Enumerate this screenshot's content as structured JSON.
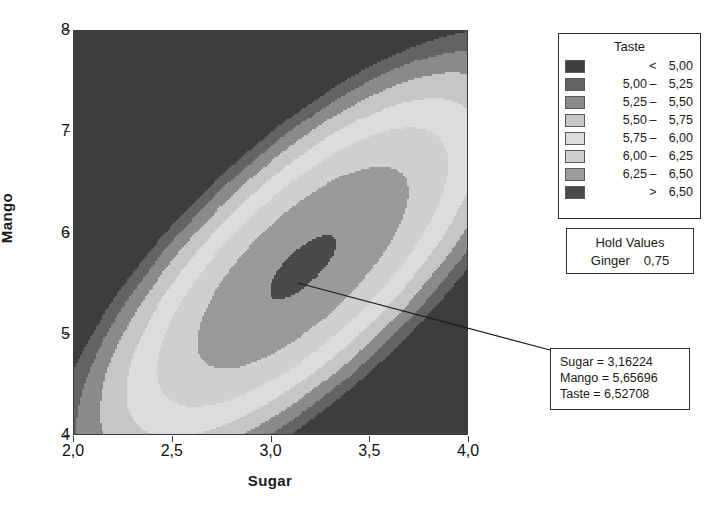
{
  "chart_data": {
    "type": "contour",
    "title": "",
    "xlabel": "Sugar",
    "ylabel": "Mango",
    "xlim": [
      2.0,
      4.0
    ],
    "ylim": [
      4.0,
      8.0
    ],
    "xticks": [
      "2,0",
      "2,5",
      "3,0",
      "3,5",
      "4,0"
    ],
    "xtick_values": [
      2.0,
      2.5,
      3.0,
      3.5,
      4.0
    ],
    "yticks": [
      "4",
      "5",
      "6",
      "7",
      "8"
    ],
    "ytick_values": [
      4,
      5,
      6,
      7,
      8
    ],
    "grid": false,
    "response_variable": "Taste",
    "maximum_point": {
      "Sugar": 3.16224,
      "Mango": 5.65696,
      "Taste": 6.52708
    },
    "hold_values": {
      "Ginger": 0.75
    },
    "levels": [
      5.0,
      5.25,
      5.5,
      5.75,
      6.0,
      6.25,
      6.5
    ],
    "bands": [
      {
        "label": "< 5,00",
        "lo": null,
        "hi": 5.0,
        "color": "#3d3d3d"
      },
      {
        "label": "5,00 - 5,25",
        "lo": 5.0,
        "hi": 5.25,
        "color": "#636363"
      },
      {
        "label": "5,25 - 5,50",
        "lo": 5.25,
        "hi": 5.5,
        "color": "#8a8a8a"
      },
      {
        "label": "5,50 - 5,75",
        "lo": 5.5,
        "hi": 5.75,
        "color": "#c6c6c6"
      },
      {
        "label": "5,75 - 6,00",
        "lo": 5.75,
        "hi": 6.0,
        "color": "#dcdcdc"
      },
      {
        "label": "6,00 - 6,25",
        "lo": 6.0,
        "hi": 6.25,
        "color": "#cfcfcf"
      },
      {
        "label": "6,25 - 6,50",
        "lo": 6.25,
        "hi": 6.5,
        "color": "#9a9a9a"
      },
      {
        "label": "> 6,50",
        "lo": 6.5,
        "hi": null,
        "color": "#4a4a4a"
      }
    ]
  },
  "axes": {
    "x_title": "Sugar",
    "y_title": "Mango",
    "x_ticks": [
      "2,0",
      "2,5",
      "3,0",
      "3,5",
      "4,0"
    ],
    "y_ticks": [
      "8",
      "7",
      "6",
      "5",
      "4"
    ]
  },
  "legend": {
    "title": "Taste",
    "rows": [
      {
        "lo": "",
        "dash": "<",
        "hi": "5,00",
        "color": "#3d3d3d"
      },
      {
        "lo": "5,00",
        "dash": "–",
        "hi": "5,25",
        "color": "#636363"
      },
      {
        "lo": "5,25",
        "dash": "–",
        "hi": "5,50",
        "color": "#8a8a8a"
      },
      {
        "lo": "5,50",
        "dash": "–",
        "hi": "5,75",
        "color": "#c6c6c6"
      },
      {
        "lo": "5,75",
        "dash": "–",
        "hi": "6,00",
        "color": "#dcdcdc"
      },
      {
        "lo": "6,00",
        "dash": "–",
        "hi": "6,25",
        "color": "#cfcfcf"
      },
      {
        "lo": "6,25",
        "dash": "–",
        "hi": "6,50",
        "color": "#9a9a9a"
      },
      {
        "lo": "",
        "dash": ">",
        "hi": "6,50",
        "color": "#4a4a4a"
      }
    ]
  },
  "hold_values": {
    "title": "Hold Values",
    "name": "Ginger",
    "value": "0,75"
  },
  "callout": {
    "line1": "Sugar = 3,16224",
    "line2": "Mango = 5,65696",
    "line3": "Taste = 6,52708"
  },
  "colors": {
    "frame": "#3a3a3a",
    "text": "#1a1a1a",
    "background": "#ffffff"
  }
}
